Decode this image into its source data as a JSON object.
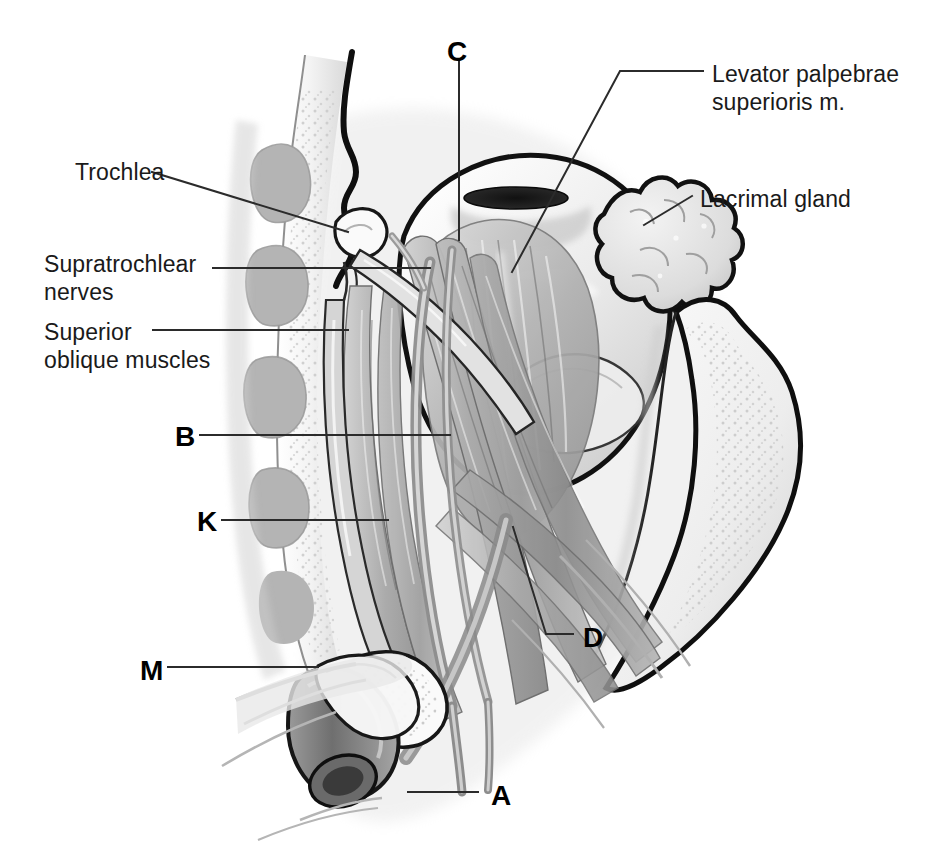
{
  "figure": {
    "background_color": "#ffffff",
    "ink_color": "#1a1a1a",
    "leader_color": "#2b2b2b"
  },
  "labels": [
    {
      "id": "trochlea",
      "text": "Trochlea",
      "kind": "text",
      "x": 75,
      "y": 158
    },
    {
      "id": "supratrochlear-nerves",
      "text": "Supratrochlear\nnerves",
      "kind": "text",
      "x": 44,
      "y": 250
    },
    {
      "id": "superior-oblique",
      "text": "Superior\noblique muscles",
      "kind": "text",
      "x": 44,
      "y": 318
    },
    {
      "id": "levator-palpebrae",
      "text": "Levator palpebrae\nsuperioris m.",
      "kind": "text",
      "x": 712,
      "y": 60
    },
    {
      "id": "lacrimal-gland",
      "text": "Lacrimal gland",
      "kind": "text",
      "x": 700,
      "y": 185
    },
    {
      "id": "key-c",
      "text": "C",
      "kind": "key",
      "x": 447,
      "y": 36
    },
    {
      "id": "key-b",
      "text": "B",
      "kind": "key",
      "x": 175,
      "y": 421
    },
    {
      "id": "key-k",
      "text": "K",
      "kind": "key",
      "x": 197,
      "y": 506
    },
    {
      "id": "key-m",
      "text": "M",
      "kind": "key",
      "x": 140,
      "y": 655
    },
    {
      "id": "key-d",
      "text": "D",
      "kind": "key",
      "x": 583,
      "y": 622
    },
    {
      "id": "key-a",
      "text": "A",
      "kind": "key",
      "x": 491,
      "y": 780
    }
  ],
  "leaders": [
    {
      "id": "leader-trochlea",
      "points": "152,172 348,232"
    },
    {
      "id": "leader-supratrochlear",
      "points": "213,268 430,268"
    },
    {
      "id": "leader-superior-oblique",
      "points": "153,330 348,330"
    },
    {
      "id": "leader-levator-palpebrae",
      "points": "703,71 620,71 512,272"
    },
    {
      "id": "leader-lacrimal-gland",
      "points": "692,196 644,225"
    },
    {
      "id": "leader-key-c",
      "points": "459,62 459,240"
    },
    {
      "id": "leader-key-b",
      "points": "200,435 450,435"
    },
    {
      "id": "leader-key-k",
      "points": "222,520 388,520"
    },
    {
      "id": "leader-key-m",
      "points": "168,667 318,667"
    },
    {
      "id": "leader-key-d",
      "points": "573,634 546,634 513,527"
    },
    {
      "id": "leader-key-a",
      "points": "478,792 408,792"
    }
  ],
  "anatomy": {
    "structures": [
      "ethmoid-air-cells-bone",
      "orbital-roof-bone",
      "lateral-orbital-wall-bone",
      "globe-eyeball",
      "cornea-pupil",
      "levator-palpebrae-superioris-muscle",
      "superior-rectus-muscle",
      "superior-oblique-muscle",
      "superior-oblique-tendon",
      "trochlea-cartilage",
      "lacrimal-gland",
      "supratrochlear-nerves",
      "frontal-nerve",
      "optic-nerve",
      "ophthalmic-artery",
      "cut-vessel-stump"
    ],
    "palette": {
      "bone_fill": "#f2f2f2",
      "bone_stipple": "#cfcfcf",
      "bone_shadow": "#b9b9b9",
      "muscle_light": "#cfcfcf",
      "muscle_mid": "#a8a8a8",
      "muscle_dark": "#7e7e7e",
      "globe_light": "#f4f4f4",
      "globe_mid": "#d8d8d8",
      "vessel_dark": "#6e6e6e",
      "outline": "#111111"
    }
  }
}
